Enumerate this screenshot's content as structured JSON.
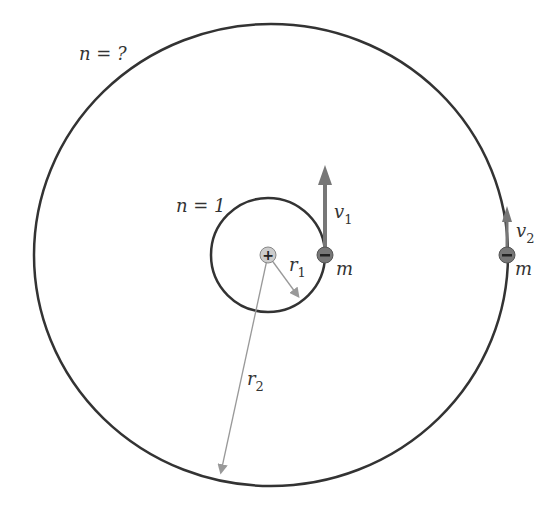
{
  "diagram": {
    "outer_orbit_label": "n = ?",
    "inner_orbit_label": "n = 1",
    "nucleus_symbol": "+",
    "electron_symbol": "−",
    "inner_velocity_label": "v",
    "inner_velocity_sub": "1",
    "outer_velocity_label": "v",
    "outer_velocity_sub": "2",
    "inner_mass_label": "m",
    "outer_mass_label": "m",
    "inner_radius_label": "r",
    "inner_radius_sub": "1",
    "outer_radius_label": "r",
    "outer_radius_sub": "2",
    "colors": {
      "orbit": "#333333",
      "arrow": "#777777",
      "radius_line": "#999999",
      "nucleus_fill": "#cccccc",
      "electron_fill": "#777777"
    }
  }
}
